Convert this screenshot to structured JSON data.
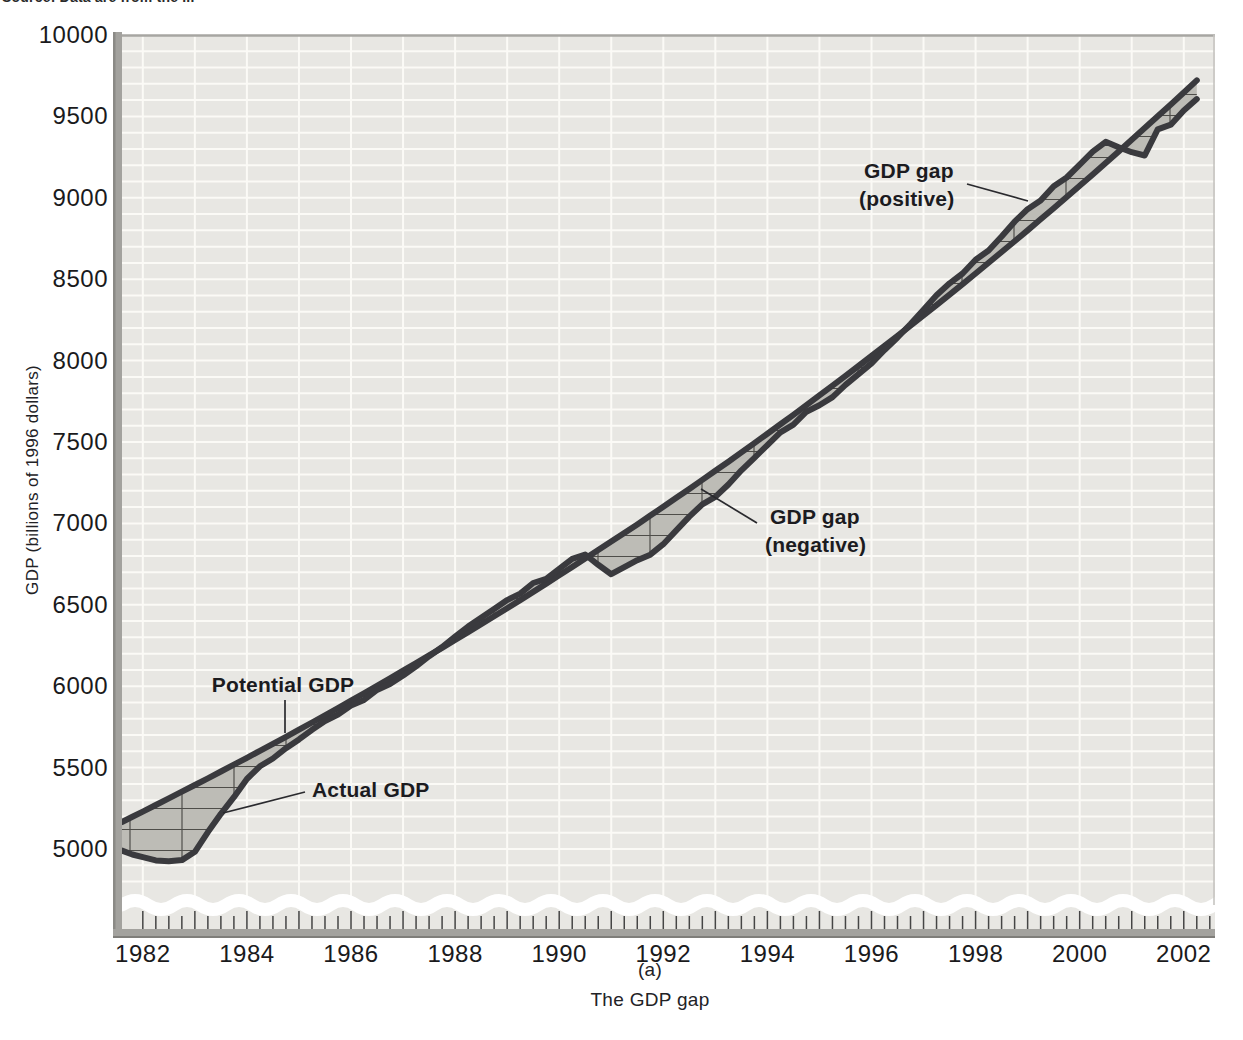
{
  "source_note": "Source: Data are from the ...",
  "y_axis_title": "GDP (billions of 1996 dollars)",
  "caption": {
    "panel_label": "(a)",
    "title": "The GDP gap"
  },
  "annotations": {
    "potential": "Potential GDP",
    "actual": "Actual GDP",
    "gap_positive_line1": "GDP gap",
    "gap_positive_line2": "(positive)",
    "gap_negative_line1": "GDP gap",
    "gap_negative_line2": "(negative)"
  },
  "colors": {
    "plot_background": "#e8e7e3",
    "gridline": "#fbfaf6",
    "curve": "#3a3a3e",
    "gap_fill": "#bdbcb6",
    "hatch_line": "#4e4d49",
    "axis_bar": "#a3a29e",
    "axis_bar_edge": "#7f7e7a",
    "text": "#1a1a1c",
    "wave_break": "#ffffff"
  },
  "chart_data": {
    "type": "line",
    "title": "The GDP gap",
    "panel": "(a)",
    "ylabel": "GDP (billions of 1996 dollars)",
    "xlabel": "",
    "x_tick_labels": [
      1982,
      1984,
      1986,
      1988,
      1990,
      1992,
      1994,
      1996,
      1998,
      2000,
      2002
    ],
    "y_tick_labels": [
      5000,
      5500,
      6000,
      6500,
      7000,
      7500,
      8000,
      8500,
      9000,
      9500,
      10000
    ],
    "x_minor_tick_step": 0.25,
    "xlim": [
      1981.6,
      2002.6
    ],
    "ylim": [
      5000,
      10000
    ],
    "grid": "white gridlines: vertical every 1 year, horizontal every 100 billion",
    "gap_fill_style": "gray band with ladder hatching between the two curves",
    "axis_break": "wavy white break line above x-axis (y-axis does not start at 0)",
    "gap_regions": [
      {
        "label": "GDP gap (negative)",
        "x_span": [
          1982.0,
          1987.6
        ],
        "note": "actual GDP below potential GDP"
      },
      {
        "label": "GDP gap (positive)",
        "x_span": [
          1987.6,
          1990.6
        ],
        "note": "small positive gap"
      },
      {
        "label": "GDP gap (negative)",
        "x_span": [
          1990.6,
          1996.8
        ],
        "note": "1990-91 recession and slow recovery"
      },
      {
        "label": "GDP gap (positive)",
        "x_span": [
          1996.8,
          2001.1
        ],
        "note": "late-1990s boom, peak about +130 in 2000"
      },
      {
        "label": "GDP gap (negative)",
        "x_span": [
          2001.1,
          2002.25
        ],
        "note": "2001 slowdown"
      }
    ],
    "x": [
      1981.6,
      1981.8,
      1982.0,
      1982.25,
      1982.5,
      1982.75,
      1983.0,
      1983.25,
      1983.5,
      1983.75,
      1984.0,
      1984.25,
      1984.5,
      1984.75,
      1985.0,
      1985.25,
      1985.5,
      1985.75,
      1986.0,
      1986.25,
      1986.5,
      1986.75,
      1987.0,
      1987.25,
      1987.5,
      1987.75,
      1988.0,
      1988.25,
      1988.5,
      1988.75,
      1989.0,
      1989.25,
      1989.5,
      1989.75,
      1990.0,
      1990.25,
      1990.5,
      1990.75,
      1991.0,
      1991.25,
      1991.5,
      1991.75,
      1992.0,
      1992.25,
      1992.5,
      1992.75,
      1993.0,
      1993.25,
      1993.5,
      1993.75,
      1994.0,
      1994.25,
      1994.5,
      1994.75,
      1995.0,
      1995.25,
      1995.5,
      1995.75,
      1996.0,
      1996.25,
      1996.5,
      1996.75,
      1997.0,
      1997.25,
      1997.5,
      1997.75,
      1998.0,
      1998.25,
      1998.5,
      1998.75,
      1999.0,
      1999.25,
      1999.5,
      1999.75,
      2000.0,
      2000.25,
      2000.5,
      2000.75,
      2001.0,
      2001.25,
      2001.5,
      2001.75,
      2002.0,
      2002.25
    ],
    "series": [
      {
        "name": "Potential GDP",
        "style": "smooth steadily rising line",
        "values": [
          5166,
          5198,
          5230,
          5270,
          5311,
          5352,
          5393,
          5434,
          5476,
          5518,
          5560,
          5603,
          5646,
          5689,
          5733,
          5777,
          5821,
          5866,
          5911,
          5956,
          6002,
          6048,
          6095,
          6142,
          6189,
          6236,
          6284,
          6332,
          6381,
          6430,
          6479,
          6529,
          6579,
          6630,
          6681,
          6732,
          6784,
          6836,
          6888,
          6941,
          6994,
          7048,
          7102,
          7157,
          7212,
          7267,
          7323,
          7379,
          7436,
          7493,
          7551,
          7609,
          7667,
          7726,
          7786,
          7846,
          7906,
          7967,
          8028,
          8090,
          8152,
          8215,
          8277,
          8341,
          8405,
          8470,
          8535,
          8601,
          8667,
          8733,
          8800,
          8868,
          8936,
          9005,
          9074,
          9144,
          9214,
          9285,
          9356,
          9428,
          9501,
          9574,
          9647,
          9721
        ]
      },
      {
        "name": "Actual GDP",
        "style": "fluctuating line",
        "values": [
          4990,
          4966,
          4950,
          4930,
          4925,
          4932,
          4983,
          5104,
          5216,
          5318,
          5430,
          5508,
          5556,
          5619,
          5673,
          5732,
          5786,
          5826,
          5881,
          5916,
          5977,
          6013,
          6065,
          6122,
          6184,
          6241,
          6304,
          6367,
          6421,
          6475,
          6529,
          6569,
          6634,
          6660,
          6721,
          6782,
          6809,
          6746,
          6688,
          6731,
          6774,
          6808,
          6872,
          6957,
          7042,
          7117,
          7163,
          7239,
          7326,
          7403,
          7481,
          7559,
          7607,
          7686,
          7726,
          7776,
          7851,
          7917,
          7983,
          8065,
          8142,
          8225,
          8312,
          8401,
          8475,
          8535,
          8620,
          8676,
          8762,
          8853,
          8930,
          8983,
          9071,
          9125,
          9204,
          9284,
          9344,
          9310,
          9280,
          9260,
          9421,
          9449,
          9537,
          9606
        ]
      }
    ]
  }
}
